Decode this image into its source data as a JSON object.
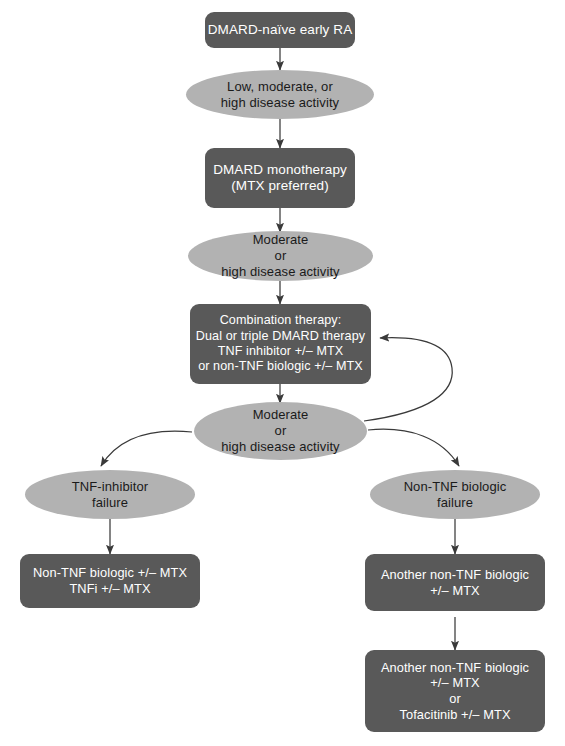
{
  "diagram": {
    "colors": {
      "box_fill": "#595959",
      "ellipse_fill": "#b2b2b2",
      "box_text": "#ffffff",
      "ellipse_text": "#1a1a1a",
      "edge_stroke": "#3a3a3a",
      "background": "#ffffff"
    },
    "nodes": [
      {
        "id": "dmard-naive-early-ra",
        "shape": "box",
        "lines": [
          "DMARD-naïve early RA"
        ]
      },
      {
        "id": "low-moderate-high-disease-activity",
        "shape": "ellipse",
        "lines": [
          "Low, moderate, or",
          "high disease activity"
        ]
      },
      {
        "id": "dmard-monotherapy",
        "shape": "box",
        "lines": [
          "DMARD monotherapy",
          "(MTX preferred)"
        ]
      },
      {
        "id": "moderate-or-high-disease-activity-1",
        "shape": "ellipse",
        "lines": [
          "Moderate",
          "or",
          "high disease activity"
        ]
      },
      {
        "id": "combination-therapy",
        "shape": "box",
        "lines": [
          "Combination therapy:",
          "Dual or triple DMARD therapy",
          "TNF inhibitor +/– MTX",
          "or non-TNF biologic +/– MTX"
        ]
      },
      {
        "id": "moderate-or-high-disease-activity-2",
        "shape": "ellipse",
        "lines": [
          "Moderate",
          "or",
          "high disease activity"
        ]
      },
      {
        "id": "tnf-inhibitor-failure",
        "shape": "ellipse",
        "lines": [
          "TNF-inhibitor",
          "failure"
        ]
      },
      {
        "id": "non-tnf-biologic-failure",
        "shape": "ellipse",
        "lines": [
          "Non-TNF biologic",
          "failure"
        ]
      },
      {
        "id": "non-tnf-biologic-or-tnfi",
        "shape": "box",
        "lines": [
          "Non-TNF biologic +/– MTX",
          "TNFi +/– MTX"
        ]
      },
      {
        "id": "another-non-tnf-biologic",
        "shape": "box",
        "lines": [
          "Another non-TNF biologic",
          "+/– MTX"
        ]
      },
      {
        "id": "another-non-tnf-biologic-or-tofacitinib",
        "shape": "box",
        "lines": [
          "Another non-TNF biologic",
          "+/– MTX",
          "or",
          "Tofacitinib +/– MTX"
        ]
      }
    ]
  }
}
